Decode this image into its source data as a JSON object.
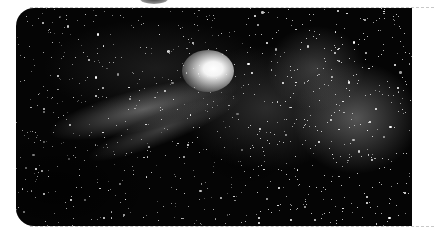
{
  "image": {
    "subject": "comet with tail over dense Milky Way starfield",
    "description": "Black-and-white astrophotograph of a comet with a bright coma and a fanned tail extending to the lower-left, set against a dense starfield and nebulous Milky Way clouds.",
    "frame": {
      "shape": "rounded-left-corners",
      "background": "#ffffff"
    },
    "colors": {
      "sky": "#050505",
      "comet_core": "#ffffff",
      "milky_way": "#969696",
      "page_background": "#ffffff",
      "edge_dash": "#c8c8c8"
    },
    "star_count": 900,
    "star_seed": 7
  }
}
